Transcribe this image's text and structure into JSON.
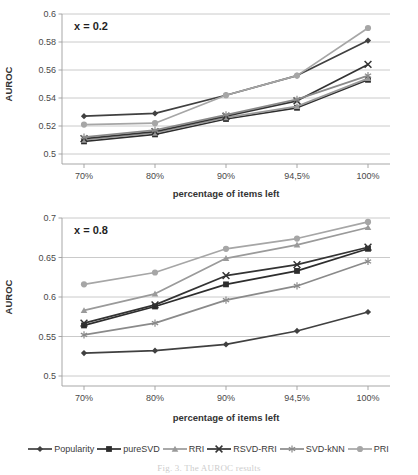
{
  "figure": {
    "caption": "Fig. 3. The AUROC results"
  },
  "legend": {
    "position": "bottom-center",
    "entries": [
      {
        "label": "Popularity",
        "marker": "diamond",
        "color": "#404040"
      },
      {
        "label": "pureSVD",
        "marker": "square",
        "color": "#2d2d2d"
      },
      {
        "label": "RRI",
        "marker": "triangle",
        "color": "#9a9a9a"
      },
      {
        "label": "RSVD-RRI",
        "marker": "cross",
        "color": "#333333"
      },
      {
        "label": "SVD-kNN",
        "marker": "asterisk",
        "color": "#8a8a8a"
      },
      {
        "label": "PRI",
        "marker": "circle",
        "color": "#a6a6a6"
      }
    ]
  },
  "chart_data": [
    {
      "id": "top",
      "type": "line",
      "title": "",
      "annotation": "x = 0.2",
      "xlabel": "percentage of items left",
      "ylabel": "AUROC",
      "categories": [
        "70%",
        "80%",
        "90%",
        "94,5%",
        "100%"
      ],
      "ylim": [
        0.5,
        0.6
      ],
      "yticks": [
        "0.5",
        "0.52",
        "0.54",
        "0.56",
        "0.58",
        "0.6"
      ],
      "grid": true,
      "series": [
        {
          "name": "Popularity",
          "marker": "diamond",
          "color": "#404040",
          "values": [
            0.527,
            0.529,
            0.542,
            0.556,
            0.581
          ]
        },
        {
          "name": "pureSVD",
          "marker": "square",
          "color": "#2d2d2d",
          "values": [
            0.509,
            0.514,
            0.525,
            0.533,
            0.553
          ]
        },
        {
          "name": "RRI",
          "marker": "triangle",
          "color": "#9a9a9a",
          "values": [
            0.51,
            0.515,
            0.526,
            0.534,
            0.554
          ]
        },
        {
          "name": "RSVD-RRI",
          "marker": "cross",
          "color": "#333333",
          "values": [
            0.511,
            0.516,
            0.527,
            0.538,
            0.564
          ]
        },
        {
          "name": "SVD-kNN",
          "marker": "asterisk",
          "color": "#8a8a8a",
          "values": [
            0.512,
            0.517,
            0.528,
            0.539,
            0.556
          ]
        },
        {
          "name": "PRI",
          "marker": "circle",
          "color": "#a6a6a6",
          "values": [
            0.521,
            0.522,
            0.542,
            0.556,
            0.59
          ]
        }
      ]
    },
    {
      "id": "bottom",
      "type": "line",
      "title": "",
      "annotation": "x = 0.8",
      "xlabel": "percentage of items  left",
      "ylabel": "AUROC",
      "categories": [
        "70%",
        "80%",
        "90%",
        "94,5%",
        "100%"
      ],
      "ylim": [
        0.5,
        0.7
      ],
      "yticks": [
        "0.5",
        "0.55",
        "0.6",
        "0.65",
        "0.7"
      ],
      "grid": true,
      "series": [
        {
          "name": "Popularity",
          "marker": "diamond",
          "color": "#404040",
          "values": [
            0.529,
            0.532,
            0.54,
            0.557,
            0.581
          ]
        },
        {
          "name": "pureSVD",
          "marker": "square",
          "color": "#2d2d2d",
          "values": [
            0.564,
            0.588,
            0.616,
            0.633,
            0.661
          ]
        },
        {
          "name": "RRI",
          "marker": "triangle",
          "color": "#9a9a9a",
          "values": [
            0.583,
            0.604,
            0.649,
            0.666,
            0.688
          ]
        },
        {
          "name": "RSVD-RRI",
          "marker": "cross",
          "color": "#333333",
          "values": [
            0.567,
            0.59,
            0.627,
            0.641,
            0.663
          ]
        },
        {
          "name": "SVD-kNN",
          "marker": "asterisk",
          "color": "#8a8a8a",
          "values": [
            0.552,
            0.567,
            0.596,
            0.614,
            0.645
          ]
        },
        {
          "name": "PRI",
          "marker": "circle",
          "color": "#a6a6a6",
          "values": [
            0.616,
            0.631,
            0.661,
            0.674,
            0.695
          ]
        }
      ]
    }
  ]
}
